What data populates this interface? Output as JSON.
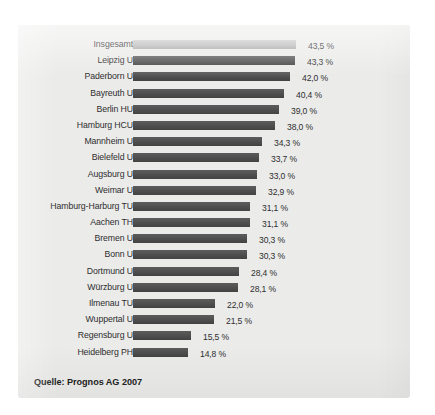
{
  "figure": {
    "source_note": "Quelle: Prognos AG 2007",
    "panel_color": "#ebebea",
    "background_color": "#ffffff",
    "bar_color": "#4a4a4a",
    "highlight_bar_color": "#b2b2b2",
    "text_color": "#2e2e2e"
  },
  "chart_data": {
    "type": "bar",
    "orientation": "horizontal",
    "title": "",
    "subtitle": "",
    "xlabel": "",
    "ylabel": "",
    "unit": "%",
    "decimal_separator": ",",
    "grid": false,
    "legend": "none",
    "xlim": [
      0,
      43.5
    ],
    "sorted": "descending",
    "categories": [
      "Insgesamt",
      "Leipzig U",
      "Paderborn U",
      "Bayreuth U",
      "Berlin HU",
      "Hamburg HCU",
      "Mannheim U",
      "Bielefeld U",
      "Augsburg U",
      "Weimar U",
      "Hamburg-Harburg TU",
      "Aachen TH",
      "Bremen U",
      "Bonn U",
      "Dortmund U",
      "Würzburg U",
      "Ilmenau TU",
      "Wuppertal U",
      "Regensburg U",
      "Heidelberg PH"
    ],
    "values": [
      43.5,
      43.3,
      42.0,
      40.4,
      39.0,
      38.0,
      34.3,
      33.7,
      33.0,
      32.9,
      31.1,
      31.1,
      30.3,
      30.3,
      28.4,
      28.1,
      22.0,
      21.5,
      15.5,
      14.8
    ],
    "value_labels": [
      "43,5 %",
      "43,3 %",
      "42,0 %",
      "40,4 %",
      "39,0 %",
      "38,0 %",
      "34,3 %",
      "33,7 %",
      "33,0 %",
      "32,9 %",
      "31,1 %",
      "31,1 %",
      "30,3 %",
      "30,3 %",
      "28,4 %",
      "28,1 %",
      "22,0 %",
      "21,5 %",
      "15,5 %",
      "14,8 %"
    ],
    "highlighted_index": 0
  }
}
